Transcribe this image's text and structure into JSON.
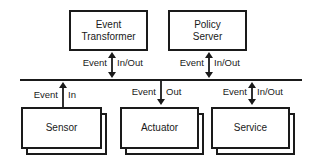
{
  "diagram": {
    "top_components": [
      {
        "id": "event-transformer",
        "label_line1": "Event",
        "label_line2": "Transformer",
        "connection_left": "Event",
        "connection_right": "In/Out",
        "direction": "bidirectional"
      },
      {
        "id": "policy-server",
        "label_line1": "Policy",
        "label_line2": "Server",
        "connection_left": "Event",
        "connection_right": "In/Out",
        "direction": "bidirectional"
      }
    ],
    "bottom_components": [
      {
        "id": "sensor",
        "label": "Sensor",
        "connection_left": "Event",
        "connection_right": "In",
        "direction": "up"
      },
      {
        "id": "actuator",
        "label": "Actuator",
        "connection_left": "Event",
        "connection_right": "Out",
        "direction": "down"
      },
      {
        "id": "service",
        "label": "Service",
        "connection_left": "Event",
        "connection_right": "In/Out",
        "direction": "bidirectional"
      }
    ],
    "bus": {
      "label": "",
      "color": "#1a1a1a"
    },
    "stroke_color": "#1a1a1a",
    "background": "#ffffff"
  }
}
